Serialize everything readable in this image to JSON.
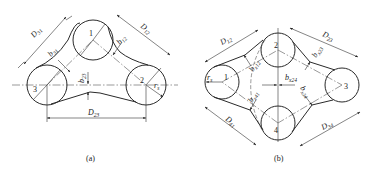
{
  "figure": {
    "panels": [
      {
        "id": "a",
        "caption": "(a)",
        "wheels": [
          {
            "label": "1"
          },
          {
            "label": "2"
          },
          {
            "label": "3"
          }
        ],
        "dimensions": {
          "D31": {
            "main": "D",
            "sub": "31"
          },
          "D12": {
            "main": "D",
            "sub": "12"
          },
          "D23": {
            "main": "D",
            "sub": "23"
          },
          "b31": {
            "main": "b",
            "sub": "31"
          },
          "b12": {
            "main": "b",
            "sub": "12"
          },
          "b23": {
            "main": "b",
            "sub": "23"
          },
          "r": {
            "main": "r",
            "sub": "s"
          }
        }
      },
      {
        "id": "b",
        "caption": "(b)",
        "wheels": [
          {
            "label": "1"
          },
          {
            "label": "2"
          },
          {
            "label": "3"
          },
          {
            "label": "4"
          }
        ],
        "dimensions": {
          "D12": {
            "main": "D",
            "sub": "12"
          },
          "D23": {
            "main": "D",
            "sub": "23"
          },
          "D34": {
            "main": "D",
            "sub": "34"
          },
          "D41": {
            "main": "D",
            "sub": "41"
          },
          "bx12": {
            "main": "b",
            "sub": "x12"
          },
          "bx23": {
            "main": "b",
            "sub": "x23"
          },
          "bx34": {
            "main": "b",
            "sub": "x34"
          },
          "bx41": {
            "main": "b",
            "sub": "x41"
          },
          "bx24": {
            "main": "b",
            "sub": "x24"
          },
          "r": {
            "main": "r",
            "sub": "s"
          }
        }
      }
    ]
  }
}
